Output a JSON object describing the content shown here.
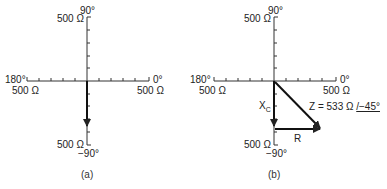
{
  "diagrams": [
    {
      "id": "a",
      "caption": "(a)",
      "labels": {
        "top_angle": "90°",
        "top_mag": "500 Ω",
        "left_angle": "180°",
        "left_mag": "500 Ω",
        "right_angle": "0°",
        "right_mag": "500 Ω",
        "bottom_mag": "500 Ω",
        "bottom_angle": "−90°"
      },
      "vectors": [
        {
          "name": "Xc",
          "direction": "-90°"
        }
      ]
    },
    {
      "id": "b",
      "caption": "(b)",
      "labels": {
        "top_angle": "90°",
        "top_mag": "500 Ω",
        "left_angle": "180°",
        "left_mag": "500 Ω",
        "right_angle": "0°",
        "right_mag": "500 Ω",
        "bottom_mag": "500 Ω",
        "bottom_angle": "−90°",
        "xc_label": "X",
        "xc_sub": "C",
        "r_label": "R",
        "z_label": "Z = 533 Ω ",
        "z_angle": "/−45°"
      },
      "vectors": [
        {
          "name": "Xc",
          "direction": "-90°"
        },
        {
          "name": "R",
          "direction": "0°"
        },
        {
          "name": "Z",
          "magnitude": "533 Ω",
          "angle": "−45°"
        }
      ]
    }
  ]
}
